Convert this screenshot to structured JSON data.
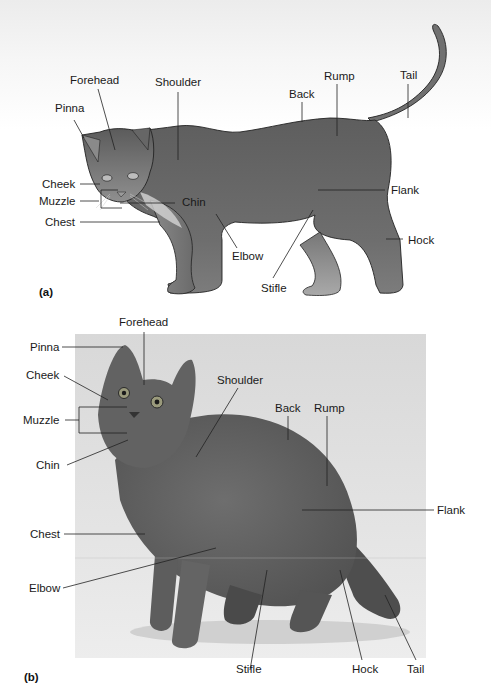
{
  "figure": {
    "panel_a": {
      "tag": "(a)",
      "kind": "illustration",
      "labels": {
        "forehead": "Forehead",
        "shoulder": "Shoulder",
        "pinna": "Pinna",
        "back": "Back",
        "rump": "Rump",
        "tail": "Tail",
        "cheek": "Cheek",
        "muzzle": "Muzzle",
        "chin": "Chin",
        "chest": "Chest",
        "flank": "Flank",
        "hock": "Hock",
        "elbow": "Elbow",
        "stifle": "Stifle"
      }
    },
    "panel_b": {
      "tag": "(b)",
      "kind": "photograph",
      "labels": {
        "forehead": "Forehead",
        "pinna": "Pinna",
        "cheek": "Cheek",
        "shoulder": "Shoulder",
        "back": "Back",
        "rump": "Rump",
        "muzzle": "Muzzle",
        "chin": "Chin",
        "flank": "Flank",
        "chest": "Chest",
        "elbow": "Elbow",
        "stifle": "Stifle",
        "hock": "Hock",
        "tail": "Tail"
      }
    },
    "colors": {
      "cat_fill": "#6f6f6f",
      "cat_dark": "#4d4d4d",
      "cat_light": "#a8a8a8",
      "photo_bg": "#dcdcdc",
      "leader_line": "#222222"
    }
  }
}
